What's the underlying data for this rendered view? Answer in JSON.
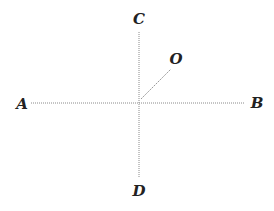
{
  "diagram": {
    "type": "cross-axes-with-ray",
    "center": {
      "x": 139,
      "y": 102
    },
    "line_color": "#8a8a8a",
    "label_color": "#222222",
    "lines": [
      {
        "name": "axis-AB",
        "from": "A",
        "to": "B",
        "style": "dotted"
      },
      {
        "name": "axis-CD",
        "from": "C",
        "to": "D",
        "style": "dotted"
      },
      {
        "name": "ray-O",
        "from": "center",
        "to": "O",
        "style": "dashed"
      }
    ],
    "labels": {
      "A": {
        "text": "A",
        "x": 22,
        "y": 104
      },
      "B": {
        "text": "B",
        "x": 257,
        "y": 103
      },
      "C": {
        "text": "C",
        "x": 139,
        "y": 19
      },
      "D": {
        "text": "D",
        "x": 139,
        "y": 191
      },
      "O": {
        "text": "O",
        "x": 176,
        "y": 59
      }
    }
  }
}
